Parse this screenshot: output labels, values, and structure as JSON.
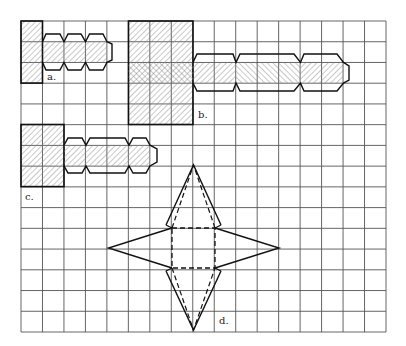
{
  "figure": {
    "grid": {
      "cols": 17,
      "rows": 15,
      "color": "#555555"
    },
    "labels": {
      "a": "a.",
      "b": "b.",
      "c": "c.",
      "d": "d."
    },
    "colors": {
      "outline": "#111111",
      "hatch": "#777777",
      "background": "#ffffff"
    }
  }
}
